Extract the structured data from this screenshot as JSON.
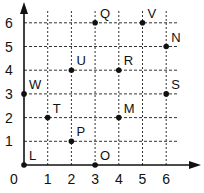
{
  "chart_data": {
    "type": "scatter",
    "title": "",
    "xlabel": "",
    "ylabel": "",
    "xlim": [
      0,
      6
    ],
    "ylim": [
      0,
      6
    ],
    "grid": true,
    "grid_style": "dashed",
    "x_ticks": [
      "0",
      "1",
      "2",
      "3",
      "4",
      "5",
      "6"
    ],
    "y_ticks": [
      "1",
      "2",
      "3",
      "4",
      "5",
      "6"
    ],
    "points": [
      {
        "label": "L",
        "x": 0,
        "y": 0
      },
      {
        "label": "O",
        "x": 3,
        "y": 0
      },
      {
        "label": "P",
        "x": 2,
        "y": 1
      },
      {
        "label": "T",
        "x": 1,
        "y": 2
      },
      {
        "label": "M",
        "x": 4,
        "y": 2
      },
      {
        "label": "W",
        "x": 0,
        "y": 3
      },
      {
        "label": "S",
        "x": 6,
        "y": 3
      },
      {
        "label": "U",
        "x": 2,
        "y": 4
      },
      {
        "label": "R",
        "x": 4,
        "y": 4
      },
      {
        "label": "N",
        "x": 6,
        "y": 5
      },
      {
        "label": "Q",
        "x": 3,
        "y": 6
      },
      {
        "label": "V",
        "x": 5,
        "y": 6
      }
    ]
  }
}
